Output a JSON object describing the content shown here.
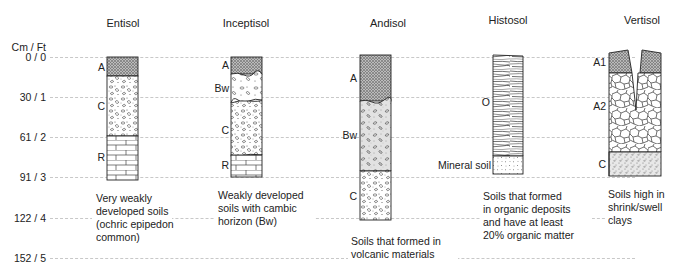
{
  "axis": {
    "header": "Cm / Ft",
    "ticks": [
      "0 / 0",
      "30 / 1",
      "61 / 2",
      "91 / 3",
      "122 / 4",
      "152 / 5"
    ]
  },
  "profiles": [
    {
      "name": "Entisol",
      "horizons": [
        "A",
        "C",
        "R"
      ],
      "description": [
        "Very weakly",
        "developed soils",
        "(ochric epipedon",
        "common)"
      ]
    },
    {
      "name": "Inceptisol",
      "horizons": [
        "A",
        "Bw",
        "C",
        "R"
      ],
      "description": [
        "Weakly developed",
        "soils with cambic",
        "horizon (Bw)"
      ]
    },
    {
      "name": "Andisol",
      "horizons": [
        "A",
        "Bw",
        "C"
      ],
      "description": [
        "Soils that formed in",
        "volcanic materials"
      ]
    },
    {
      "name": "Histosol",
      "horizons": [
        "O",
        "Mineral soil"
      ],
      "description": [
        "Soils that formed",
        "in organic deposits",
        "and have at least",
        "20% organic matter"
      ]
    },
    {
      "name": "Vertisol",
      "horizons": [
        "A1",
        "A2",
        "C"
      ],
      "description": [
        "Soils high in",
        "shrink/swell",
        "clays"
      ]
    }
  ]
}
